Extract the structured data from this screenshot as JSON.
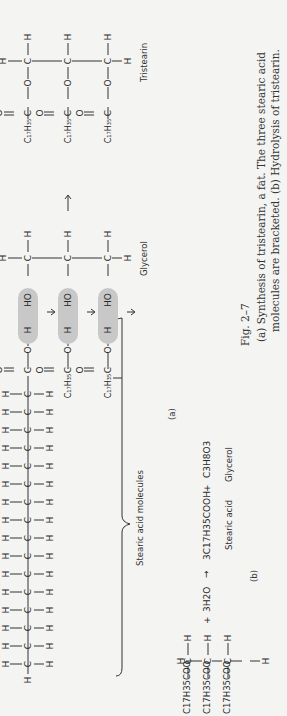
{
  "figure": {
    "number": "Fig. 2–7",
    "caption_line1": "(a) Synthesis of tristearin, a fat. The three stearic acid",
    "caption_line2": "molecules are bracketed. (b) Hydrolysis of tristearin."
  },
  "panel_a": {
    "label": "(a)",
    "stearic_label": "Stearic acid molecules",
    "glycerol_label": "Glycerol",
    "tristearin_label": "Tristearin",
    "chain_carbons": 17,
    "acyl_group": "C17H35",
    "shade_color": "#c8c8c8"
  },
  "panel_b": {
    "label": "(b)",
    "reactant_groups": [
      "C17H35COO",
      "C17H35COO",
      "C17H35COO"
    ],
    "plus1": "+",
    "water": "3H2O",
    "arrow": "→",
    "product1": "3C17H35COOH",
    "plus2": "+",
    "product2": "C3H8O3",
    "product1_label": "Stearic acid",
    "product2_label": "Glycerol"
  }
}
